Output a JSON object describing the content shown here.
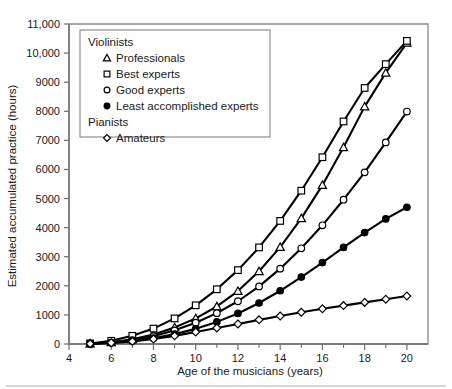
{
  "chart_data": {
    "type": "line",
    "title": "",
    "xlabel": "Age of the musicians (years)",
    "ylabel": "Estimated accumulated practice (hours)",
    "xlim": [
      4,
      21
    ],
    "ylim": [
      0,
      11000
    ],
    "grid": false,
    "legend_position": "top-left-inside",
    "x_ticklabels": [
      "4",
      "6",
      "8",
      "10",
      "12",
      "14",
      "16",
      "18",
      "20"
    ],
    "x_tickvalues": [
      4,
      6,
      8,
      10,
      12,
      14,
      16,
      18,
      20
    ],
    "x_minor_tickvalues": [
      5,
      7,
      9,
      11,
      13,
      15,
      17,
      19
    ],
    "y_ticklabels": [
      "0",
      "1000",
      "2000",
      "3000",
      "4000",
      "5000",
      "6000",
      "7000",
      "8000",
      "9000",
      "10,000",
      "11,000"
    ],
    "y_tickvalues": [
      0,
      1000,
      2000,
      3000,
      4000,
      5000,
      6000,
      7000,
      8000,
      9000,
      10000,
      11000
    ],
    "x": [
      5,
      6,
      7,
      8,
      9,
      10,
      11,
      12,
      13,
      14,
      15,
      16,
      17,
      18,
      19,
      20
    ],
    "series": [
      {
        "name": "Professionals",
        "group": "Violinists",
        "marker": "triangle",
        "values": [
          10,
          60,
          160,
          330,
          570,
          880,
          1290,
          1820,
          2500,
          3330,
          4320,
          5460,
          6760,
          8160,
          9320,
          10350
        ]
      },
      {
        "name": "Best experts",
        "group": "Violinists",
        "marker": "square",
        "values": [
          20,
          110,
          280,
          530,
          880,
          1330,
          1880,
          2540,
          3320,
          4230,
          5270,
          6420,
          7650,
          8800,
          9620,
          10420
        ]
      },
      {
        "name": "Good experts",
        "group": "Violinists",
        "marker": "circle-open",
        "values": [
          10,
          50,
          130,
          270,
          470,
          730,
          1060,
          1470,
          1980,
          2590,
          3290,
          4080,
          4960,
          5900,
          6930,
          7990
        ]
      },
      {
        "name": "Least accomplished experts",
        "group": "Violinists",
        "marker": "circle-filled",
        "values": [
          10,
          40,
          100,
          200,
          340,
          520,
          760,
          1050,
          1410,
          1830,
          2300,
          2800,
          3320,
          3830,
          4300,
          4700
        ]
      },
      {
        "name": "Amateurs",
        "group": "Pianists",
        "marker": "diamond",
        "values": [
          10,
          40,
          90,
          170,
          280,
          410,
          550,
          690,
          830,
          960,
          1090,
          1210,
          1320,
          1430,
          1540,
          1650
        ]
      }
    ],
    "legend": {
      "groups": [
        {
          "heading": "Violinists",
          "entries": [
            {
              "label": "Professionals",
              "marker": "triangle"
            },
            {
              "label": "Best experts",
              "marker": "square"
            },
            {
              "label": "Good experts",
              "marker": "circle-open"
            },
            {
              "label": "Least accomplished experts",
              "marker": "circle-filled"
            }
          ]
        },
        {
          "heading": "Pianists",
          "entries": [
            {
              "label": "Amateurs",
              "marker": "diamond"
            }
          ]
        }
      ]
    },
    "colors": {
      "line": "#000000",
      "marker_fill": "#ffffff",
      "axis": "#6e6e6e",
      "frame": "#8a8a8a",
      "background": "#ffffff"
    }
  }
}
